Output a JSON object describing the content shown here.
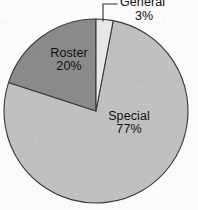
{
  "chart_data": {
    "type": "pie",
    "title": "",
    "subtitle": "",
    "xlabel": "",
    "ylabel": "",
    "legend_position": "none",
    "grid": false,
    "labels_inside": true,
    "start_angle_deg": 0,
    "direction": "clockwise",
    "categories": [
      "General",
      "Special",
      "Roster"
    ],
    "values": [
      3,
      77,
      20
    ],
    "unit": "%",
    "slices": [
      {
        "name": "General",
        "value": 3,
        "value_label": "3%",
        "color": "#e8e8e8",
        "label_placement": "callout-top",
        "start_deg": 0,
        "end_deg": 10.8
      },
      {
        "name": "Special",
        "value": 77,
        "value_label": "77%",
        "color": "#c0c0c0",
        "label_placement": "inside",
        "start_deg": 10.8,
        "end_deg": 288
      },
      {
        "name": "Roster",
        "value": 20,
        "value_label": "20%",
        "color": "#8a8a8a",
        "label_placement": "inside",
        "start_deg": 288,
        "end_deg": 360
      }
    ],
    "geometry": {
      "center_x": 96,
      "center_y": 111,
      "radius": 92
    },
    "style": {
      "background": "#fbfbfb",
      "outline_color": "#3a3a3a",
      "leader_line_color": "#2e2e2e",
      "text_color": "#111111"
    }
  }
}
